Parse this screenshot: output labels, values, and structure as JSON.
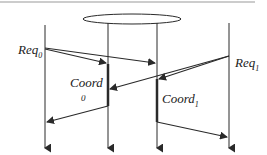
{
  "diagram": {
    "type": "sequence/timeline",
    "labels": {
      "req0": "Req",
      "req0_sub": "0",
      "req1": "Req",
      "req1_sub": "1",
      "coord0": "Coord",
      "coord0_sub": "0",
      "coord1": "Coord",
      "coord1_sub": "1"
    },
    "process_lines": 4,
    "colors": {
      "line": "#2a2a2a",
      "top_rule": "#888888"
    }
  }
}
